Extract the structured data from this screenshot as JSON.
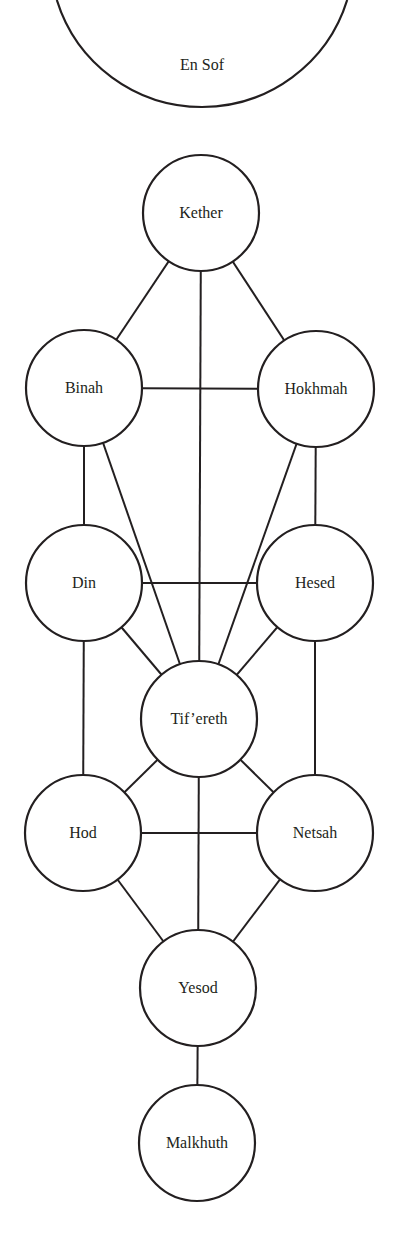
{
  "diagram": {
    "colors": {
      "stroke": "#231f20",
      "background": "#ffffff",
      "text": "#231f20"
    },
    "en_sof": {
      "label": "En Sof",
      "cx": 202,
      "cy": -45,
      "r": 152
    },
    "node_radius": 58,
    "nodes": [
      {
        "id": "kether",
        "label": "Kether",
        "cx": 201,
        "cy": 213
      },
      {
        "id": "binah",
        "label": "Binah",
        "cx": 84,
        "cy": 388
      },
      {
        "id": "hokhmah",
        "label": "Hokhmah",
        "cx": 316,
        "cy": 389
      },
      {
        "id": "din",
        "label": "Din",
        "cx": 84,
        "cy": 583
      },
      {
        "id": "hesed",
        "label": "Hesed",
        "cx": 315,
        "cy": 583
      },
      {
        "id": "tifereth",
        "label": "Tif’ereth",
        "cx": 199,
        "cy": 719
      },
      {
        "id": "hod",
        "label": "Hod",
        "cx": 83,
        "cy": 833
      },
      {
        "id": "netsah",
        "label": "Netsah",
        "cx": 315,
        "cy": 833
      },
      {
        "id": "yesod",
        "label": "Yesod",
        "cx": 198,
        "cy": 988
      },
      {
        "id": "malkhuth",
        "label": "Malkhuth",
        "cx": 197,
        "cy": 1143
      }
    ],
    "edges": [
      [
        "kether",
        "binah"
      ],
      [
        "kether",
        "hokhmah"
      ],
      [
        "kether",
        "tifereth"
      ],
      [
        "binah",
        "hokhmah"
      ],
      [
        "binah",
        "din"
      ],
      [
        "hokhmah",
        "hesed"
      ],
      [
        "binah",
        "tifereth"
      ],
      [
        "hokhmah",
        "tifereth"
      ],
      [
        "din",
        "hesed"
      ],
      [
        "din",
        "tifereth"
      ],
      [
        "hesed",
        "tifereth"
      ],
      [
        "din",
        "hod"
      ],
      [
        "hesed",
        "netsah"
      ],
      [
        "tifereth",
        "hod"
      ],
      [
        "tifereth",
        "netsah"
      ],
      [
        "hod",
        "netsah"
      ],
      [
        "tifereth",
        "yesod"
      ],
      [
        "hod",
        "yesod"
      ],
      [
        "netsah",
        "yesod"
      ],
      [
        "yesod",
        "malkhuth"
      ]
    ]
  }
}
